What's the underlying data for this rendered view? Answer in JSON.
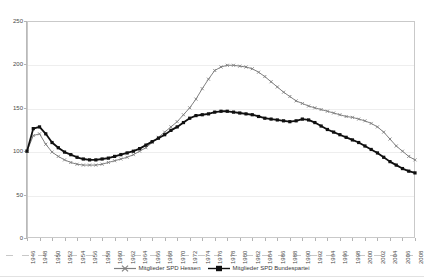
{
  "top_caption": "",
  "chart_data": {
    "type": "line",
    "title": "",
    "subtitle": "",
    "xlabel": "",
    "ylabel": "",
    "ylim": [
      0,
      250
    ],
    "y_ticks": [
      0,
      50,
      100,
      150,
      200,
      250
    ],
    "grid": true,
    "legend_position": "bottom",
    "x_tick_step": 2,
    "x": [
      1946,
      1947,
      1948,
      1949,
      1950,
      1951,
      1952,
      1953,
      1954,
      1955,
      1956,
      1957,
      1958,
      1959,
      1960,
      1961,
      1962,
      1963,
      1964,
      1965,
      1966,
      1967,
      1968,
      1969,
      1970,
      1971,
      1972,
      1973,
      1974,
      1975,
      1976,
      1977,
      1978,
      1979,
      1980,
      1981,
      1982,
      1983,
      1984,
      1985,
      1986,
      1987,
      1988,
      1989,
      1990,
      1991,
      1992,
      1993,
      1994,
      1995,
      1996,
      1997,
      1998,
      1999,
      2000,
      2001,
      2002,
      2003,
      2004,
      2005,
      2006,
      2007,
      2008
    ],
    "x_tick_labels": [
      "1946",
      "1948",
      "1950",
      "1952",
      "1954",
      "1956",
      "1958",
      "1960",
      "1962",
      "1964",
      "1966",
      "1968",
      "1970",
      "1972",
      "1974",
      "1976",
      "1978",
      "1980",
      "1982",
      "1984",
      "1986",
      "1988",
      "1990",
      "1992",
      "1994",
      "1996",
      "1998",
      "2000",
      "2002",
      "2004",
      "2006",
      "2008"
    ],
    "series": [
      {
        "name": "Mitglieder SPD Hessen",
        "color": "#808080",
        "marker": "cross",
        "values": [
          100,
          118,
          120,
          108,
          99,
          94,
          90,
          87,
          85,
          84,
          84,
          84,
          85,
          87,
          89,
          91,
          93,
          96,
          100,
          104,
          110,
          116,
          122,
          128,
          134,
          142,
          150,
          160,
          172,
          183,
          193,
          197,
          199,
          199,
          198,
          197,
          195,
          191,
          186,
          180,
          174,
          168,
          163,
          158,
          155,
          152,
          150,
          148,
          146,
          144,
          142,
          140,
          139,
          137,
          135,
          132,
          128,
          122,
          114,
          106,
          100,
          94,
          90
        ]
      },
      {
        "name": "Mitglieder SPD Bundespartei",
        "color": "#101010",
        "marker": "square",
        "values": [
          100,
          126,
          128,
          120,
          110,
          104,
          99,
          96,
          93,
          91,
          90,
          90,
          91,
          92,
          94,
          96,
          98,
          100,
          103,
          107,
          111,
          115,
          119,
          124,
          128,
          133,
          138,
          141,
          142,
          143,
          145,
          146,
          146,
          145,
          144,
          143,
          142,
          140,
          138,
          137,
          136,
          135,
          134,
          135,
          137,
          136,
          133,
          129,
          125,
          122,
          119,
          116,
          113,
          110,
          106,
          102,
          98,
          93,
          88,
          84,
          80,
          77,
          75
        ]
      }
    ]
  },
  "legend": {
    "entries": [
      {
        "label": "Mitglieder SPD Hessen"
      },
      {
        "label": "Mitglieder SPD Bundespartei"
      }
    ]
  }
}
